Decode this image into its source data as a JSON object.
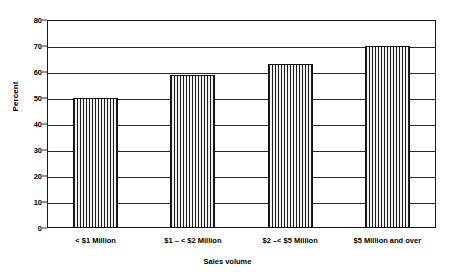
{
  "chart_data": {
    "type": "bar",
    "title": "",
    "xlabel": "Sales volume",
    "ylabel": "Percent",
    "categories": [
      "< $1 Million",
      "$1 – < $2 Million",
      "$2 –< $5 Million",
      "$5 Million and over"
    ],
    "values": [
      50,
      59,
      63,
      70
    ],
    "ylim": [
      0,
      80
    ],
    "ytick_labels": [
      "0",
      "10",
      "20",
      "30",
      "40",
      "50",
      "60",
      "70",
      "80"
    ],
    "ytick_values": [
      0,
      10,
      20,
      30,
      40,
      50,
      60,
      70,
      80
    ],
    "grid": "horizontal",
    "legend": "none",
    "bar_fill": "crosshatch",
    "colors": {
      "axis": "#1a1a1a",
      "grid": "#2b2b2b",
      "bar_line": "#1c1c1c",
      "bar_background": "#f2f2f2",
      "text": "#000000",
      "plot_background": "#ffffff"
    }
  }
}
